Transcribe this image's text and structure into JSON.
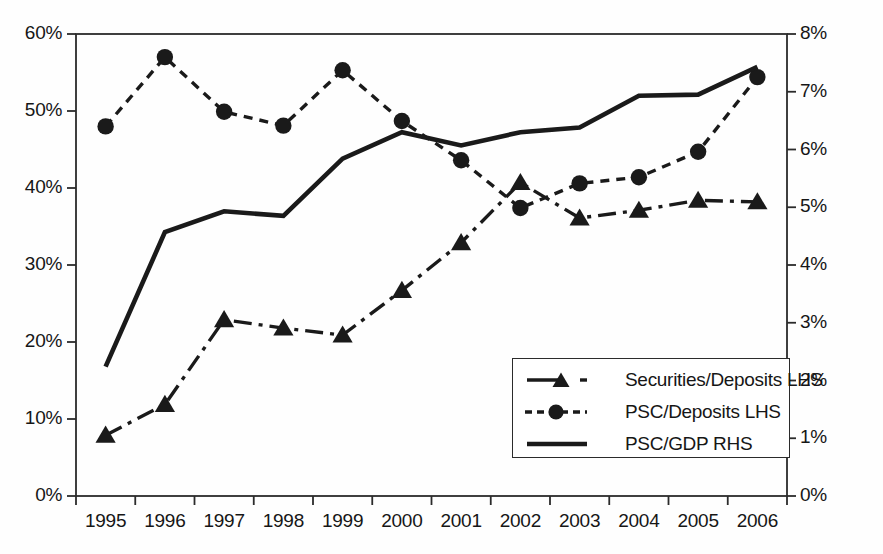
{
  "chart_data": {
    "type": "line",
    "title": "",
    "subtitle": "",
    "xlabel": "",
    "ylabel": "",
    "grid": false,
    "legend_position": "inside-bottom-right",
    "categories": [
      "1995",
      "1996",
      "1997",
      "1998",
      "1999",
      "2000",
      "2001",
      "2002",
      "2003",
      "2004",
      "2005",
      "2006"
    ],
    "axes": {
      "left": {
        "label": "",
        "ylim": [
          0,
          60
        ],
        "ticks": [
          0,
          10,
          20,
          30,
          40,
          50,
          60
        ],
        "tick_labels": [
          "0%",
          "10%",
          "20%",
          "30%",
          "40%",
          "50%",
          "60%"
        ],
        "unit": "%"
      },
      "right": {
        "label": "",
        "ylim": [
          0,
          8
        ],
        "ticks": [
          0,
          1,
          2,
          3,
          4,
          5,
          6,
          7,
          8
        ],
        "tick_labels": [
          "0%",
          "1%",
          "2%",
          "3%",
          "4%",
          "5%",
          "6%",
          "7%",
          "8%"
        ],
        "unit": "%"
      },
      "x": {
        "tick_labels": [
          "1995",
          "1996",
          "1997",
          "1998",
          "1999",
          "2000",
          "2001",
          "2002",
          "2003",
          "2004",
          "2005",
          "2006"
        ]
      }
    },
    "series": [
      {
        "name": "Securities/Deposits LHS",
        "axis": "left",
        "marker": "triangle",
        "line_style": "dash-dot",
        "color": "#1a1a1a",
        "values": [
          7.9,
          11.9,
          22.9,
          21.8,
          20.9,
          26.7,
          32.9,
          40.7,
          36.1,
          37.1,
          38.4,
          38.2
        ]
      },
      {
        "name": "PSC/Deposits LHS",
        "axis": "left",
        "marker": "circle",
        "line_style": "dashed",
        "color": "#1a1a1a",
        "values": [
          48.0,
          57.0,
          49.9,
          48.1,
          55.3,
          48.7,
          43.6,
          37.4,
          40.6,
          41.4,
          44.7,
          54.4
        ]
      },
      {
        "name": "PSC/GDP RHS",
        "axis": "right",
        "marker": "none",
        "line_style": "solid",
        "color": "#1a1a1a",
        "values": [
          2.24,
          4.57,
          4.93,
          4.85,
          5.84,
          6.3,
          6.07,
          6.3,
          6.38,
          6.93,
          6.95,
          7.43
        ]
      }
    ]
  },
  "legend": {
    "entries": [
      {
        "label": "Securities/Deposits LHS",
        "style": "dash-dot-triangle"
      },
      {
        "label": "PSC/Deposits LHS",
        "style": "dashed-circle"
      },
      {
        "label": "PSC/GDP RHS",
        "style": "solid"
      }
    ]
  }
}
